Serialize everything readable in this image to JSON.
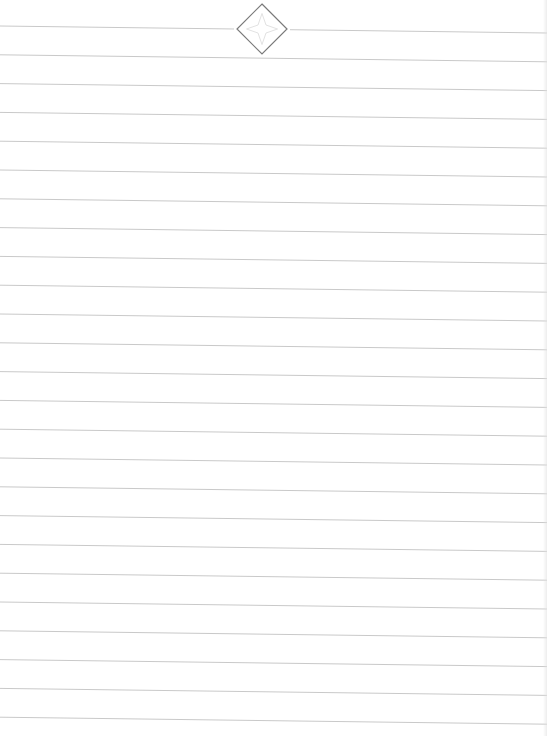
{
  "document": {
    "title": "Lined notepaper",
    "page_width": 547,
    "page_height": 736,
    "background_color": "#ffffff",
    "line_color": "#c9c9c9",
    "line_count": 25,
    "first_line_y_left": 26,
    "first_line_y_right": 33,
    "line_spacing": 28.8,
    "ornament": {
      "shape": "diamond",
      "icon": "diamond-star-ornament-icon",
      "center_x": 262,
      "center_y": 29,
      "half_size": 25,
      "stroke_color": "#7a7a7a",
      "inner_star_color": "#e2e2e2",
      "gap_left_x": 234,
      "gap_right_x": 290
    }
  }
}
